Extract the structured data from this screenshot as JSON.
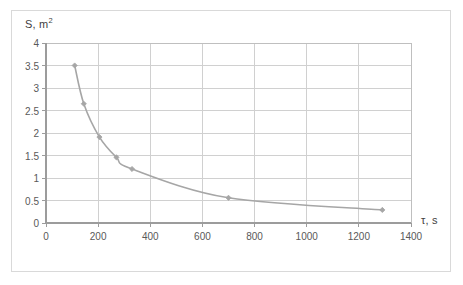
{
  "chart_data": {
    "type": "line",
    "title": "",
    "xlabel": "τ, s",
    "ylabel": "S, m2",
    "ylabel_base": "S, m",
    "ylabel_exponent": "2",
    "xlim": [
      0,
      1400
    ],
    "ylim": [
      0,
      4
    ],
    "xticks": [
      0,
      200,
      400,
      600,
      800,
      1000,
      1200,
      1400
    ],
    "yticks": [
      0,
      0.5,
      1,
      1.5,
      2,
      2.5,
      3,
      3.5,
      4
    ],
    "xtick_labels": [
      "0",
      "200",
      "400",
      "600",
      "800",
      "1000",
      "1200",
      "1400"
    ],
    "ytick_labels": [
      "0",
      "0.5",
      "1",
      "1.5",
      "2",
      "2.5",
      "3",
      "3.5",
      "4"
    ],
    "grid": "horizontal-and-vertical",
    "legend": "none",
    "series": [
      {
        "name": "S(τ)",
        "marker": "diamond",
        "color": "#a6a6a6",
        "line_color": "#a6a6a6",
        "x": [
          110,
          145,
          205,
          270,
          330,
          700,
          1290
        ],
        "y": [
          3.5,
          2.65,
          1.91,
          1.46,
          1.2,
          0.56,
          0.29
        ]
      }
    ]
  },
  "figure": {
    "border_color": "#d9d9d9",
    "background": "#ffffff",
    "grid_color": "#d0d0d0",
    "axis_color": "#bfbfbf",
    "tick_text_color": "#595959",
    "label_text_color": "#3f3f3f"
  }
}
